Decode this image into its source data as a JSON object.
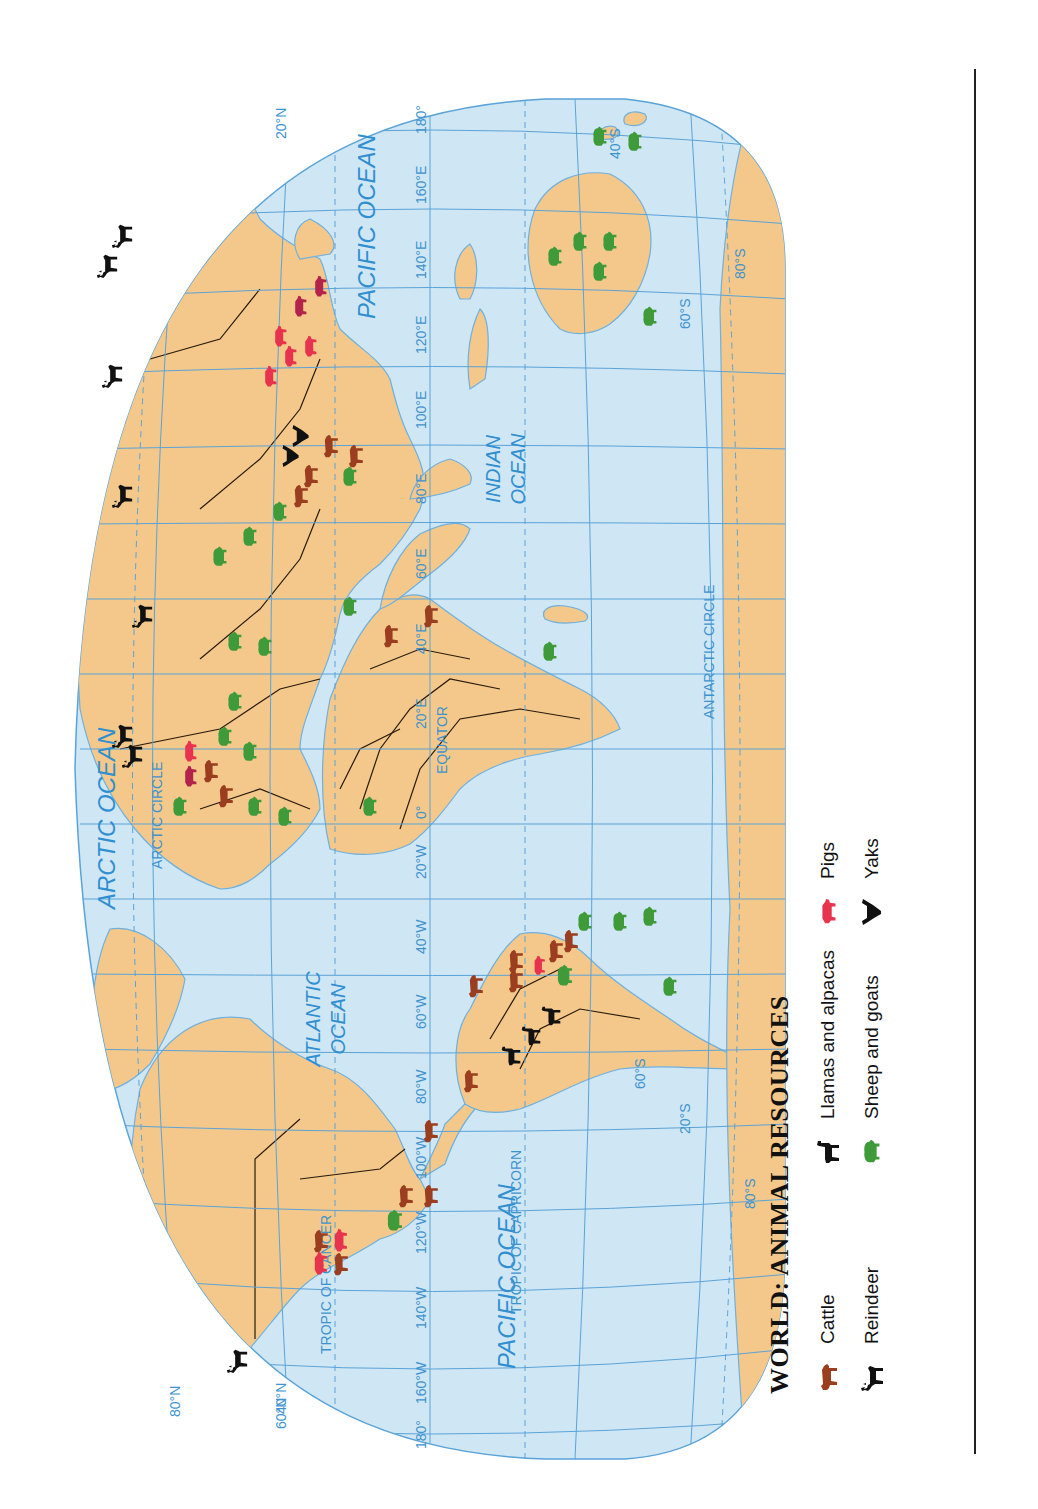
{
  "map": {
    "title": "WORLD: ANIMAL RESOURCES",
    "orientation": "rotated -90deg (landscape page printed sideways)",
    "colors": {
      "ocean": "#cfe6f5",
      "land": "#f3c88a",
      "border": "#2a1a0c",
      "grid": "#5aa3d8",
      "label": "#2f8fd0",
      "cattle": "#9a3e1f",
      "pigs": "#e8334f",
      "pigs_dark": "#b3234a",
      "sheep_goats": "#3f9a3a",
      "reindeer": "#111111",
      "llamas": "#111111",
      "yaks": "#111111"
    },
    "ocean_labels": [
      "ARCTIC OCEAN",
      "ATLANTIC OCEAN",
      "PACIFIC OCEAN",
      "PACIFIC OCEAN",
      "INDIAN OCEAN"
    ],
    "line_labels": {
      "arctic_circle": "ARCTIC CIRCLE",
      "tropic_cancer": "TROPIC OF CANCER",
      "equator": "EQUATOR",
      "tropic_capricorn": "TROPIC OF CAPRICORN",
      "antarctic_circle": "ANTARCTIC CIRCLE"
    },
    "longitude_labels": [
      "180°",
      "160°W",
      "140°W",
      "120°W",
      "100°W",
      "80°W",
      "60°W",
      "40°W",
      "20°W",
      "0°",
      "20°E",
      "40°E",
      "60°E",
      "80°E",
      "100°E",
      "120°E",
      "140°E",
      "160°E",
      "180°"
    ],
    "latitude_labels": [
      "80°N",
      "60°N",
      "40°N",
      "20°N",
      "0°",
      "20°S",
      "40°S",
      "60°S",
      "80°S"
    ]
  },
  "legend": {
    "title": "WORLD: ANIMAL RESOURCES",
    "items": [
      {
        "label": "Cattle",
        "icon": "cattle-icon",
        "color": "#9a3e1f"
      },
      {
        "label": "Reindeer",
        "icon": "reindeer-icon",
        "color": "#111111"
      },
      {
        "label": "Llamas and alpacas",
        "icon": "llama-icon",
        "color": "#111111"
      },
      {
        "label": "Sheep and goats",
        "icon": "sheep-icon",
        "color": "#3f9a3a"
      },
      {
        "label": "Pigs",
        "icon": "pig-icon",
        "color": "#e8334f"
      },
      {
        "label": "Yaks",
        "icon": "yak-icon",
        "color": "#111111"
      }
    ]
  }
}
